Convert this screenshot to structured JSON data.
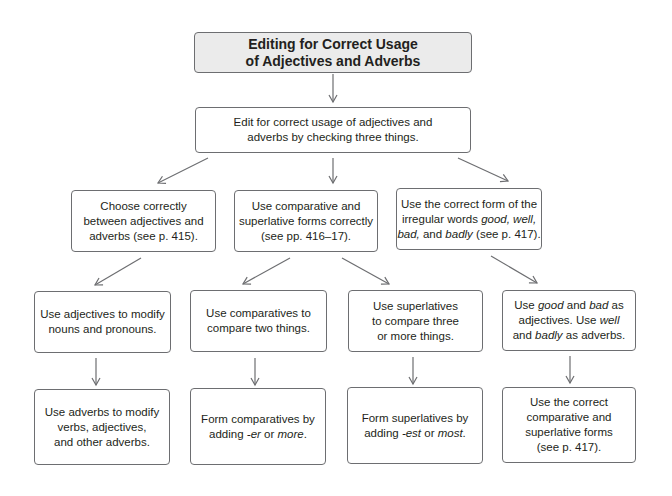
{
  "diagram": {
    "title": {
      "lines": [
        "Editing for Correct Usage",
        "of Adjectives and Adverbs"
      ]
    },
    "intro": {
      "lines": [
        "Edit for correct usage of adjectives and",
        "adverbs by checking three things."
      ]
    },
    "level2": [
      {
        "lines": [
          "Choose correctly",
          "between adjectives and",
          "adverbs (see p. 415)."
        ]
      },
      {
        "lines": [
          "Use comparative and",
          "superlative forms correctly",
          "(see pp. 416–17)."
        ]
      },
      {
        "line1": "Use the correct form of the",
        "line2_a": "irregular words ",
        "line2_b": "good, well,",
        "line3_a": "bad,",
        "line3_b": " and ",
        "line3_c": "badly",
        "line3_d": " (see p. 417)."
      }
    ],
    "level3": [
      {
        "lines": [
          "Use adjectives to modify",
          "nouns and pronouns."
        ]
      },
      {
        "lines": [
          "Use comparatives to",
          "compare two things."
        ]
      },
      {
        "lines": [
          "Use superlatives",
          "to compare three",
          "or more things."
        ]
      },
      {
        "line1_a": "Use ",
        "line1_b": "good",
        "line1_c": " and ",
        "line1_d": "bad",
        "line1_e": " as",
        "line2_a": "adjectives. Use ",
        "line2_b": "well",
        "line3_a": "and ",
        "line3_b": "badly",
        "line3_c": " as adverbs."
      }
    ],
    "level4": [
      {
        "lines": [
          "Use adverbs to modify",
          "verbs, adjectives,",
          "and other adverbs."
        ]
      },
      {
        "line1": "Form comparatives by",
        "line2_a": "adding ",
        "line2_b": "-er",
        "line2_c": " or ",
        "line2_d": "more",
        "line2_e": "."
      },
      {
        "line1": "Form superlatives by",
        "line2_a": "adding ",
        "line2_b": "-est",
        "line2_c": " or ",
        "line2_d": "most",
        "line2_e": "."
      },
      {
        "lines": [
          "Use the correct",
          "comparative and",
          "superlative forms",
          "(see p. 417)."
        ]
      }
    ],
    "colors": {
      "title_fill": "#ebebeb",
      "border": "#6d6e71",
      "arrow": "#6d6e71",
      "text": "#231f20"
    }
  }
}
